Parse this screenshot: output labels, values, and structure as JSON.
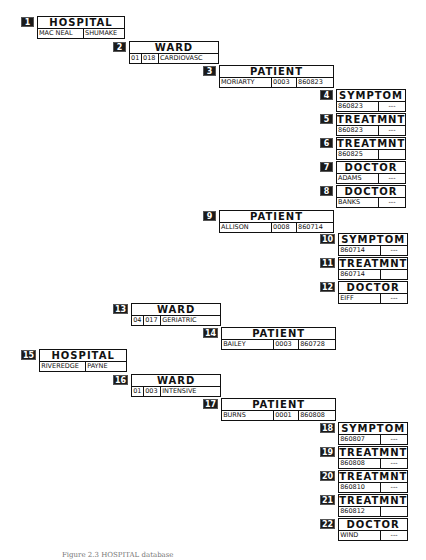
{
  "segments": [
    {
      "num": "1",
      "type": "HOSPITAL",
      "fields": [
        "MAC NEAL",
        "SHUMAKE"
      ]
    },
    {
      "num": "2",
      "type": "WARD",
      "fields": [
        "01",
        "018",
        "CARDIOVASC"
      ]
    },
    {
      "num": "3",
      "type": "PATIENT",
      "fields": [
        "MORIARTY",
        "0003",
        "860823"
      ]
    },
    {
      "num": "4",
      "type": "SYMPTOM",
      "fields": [
        "860823",
        "---"
      ]
    },
    {
      "num": "5",
      "type": "TREATMNT",
      "fields": [
        "860823",
        "---"
      ]
    },
    {
      "num": "6",
      "type": "TREATMNT",
      "fields": [
        "860825",
        ""
      ]
    },
    {
      "num": "7",
      "type": "DOCTOR",
      "fields": [
        "ADAMS",
        "---"
      ]
    },
    {
      "num": "8",
      "type": "DOCTOR",
      "fields": [
        "BANKS",
        "---"
      ]
    },
    {
      "num": "9",
      "type": "PATIENT",
      "fields": [
        "ALLISON",
        "0008",
        "860714"
      ]
    },
    {
      "num": "10",
      "type": "SYMPTOM",
      "fields": [
        "860714",
        "---"
      ]
    },
    {
      "num": "11",
      "type": "TREATMNT",
      "fields": [
        "860714",
        ""
      ]
    },
    {
      "num": "12",
      "type": "DOCTOR",
      "fields": [
        "EIFF",
        "---"
      ]
    },
    {
      "num": "13",
      "type": "WARD",
      "fields": [
        "04",
        "017",
        "GERIATRIC"
      ]
    },
    {
      "num": "14",
      "type": "PATIENT",
      "fields": [
        "BAILEY",
        "0003",
        "860728"
      ]
    },
    {
      "num": "15",
      "type": "HOSPITAL",
      "fields": [
        "RIVEREDGE",
        "PAYNE"
      ]
    },
    {
      "num": "16",
      "type": "WARD",
      "fields": [
        "01",
        "003",
        "INTENSIVE"
      ]
    },
    {
      "num": "17",
      "type": "PATIENT",
      "fields": [
        "BURNS",
        "0001",
        "860808"
      ]
    },
    {
      "num": "18",
      "type": "SYMPTOM",
      "fields": [
        "860807",
        "---"
      ]
    },
    {
      "num": "19",
      "type": "TREATMNT",
      "fields": [
        "860808",
        "---"
      ]
    },
    {
      "num": "20",
      "type": "TREATMNT",
      "fields": [
        "860810",
        "---"
      ]
    },
    {
      "num": "21",
      "type": "TREATMNT",
      "fields": [
        "860812",
        ""
      ]
    },
    {
      "num": "22",
      "type": "DOCTOR",
      "fields": [
        "WIND",
        "---"
      ]
    }
  ],
  "caption": "Figure 2.3  HOSPITAL database"
}
